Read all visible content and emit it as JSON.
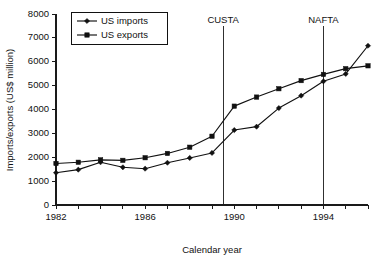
{
  "chart_data": {
    "type": "line",
    "title": "",
    "xlabel": "Calendar year",
    "ylabel": "Imports/exports (US$ million)",
    "xlim": [
      1982,
      1996
    ],
    "ylim": [
      0,
      8000
    ],
    "grid": false,
    "legend_position": "top-left",
    "x": [
      1982,
      1983,
      1984,
      1985,
      1986,
      1987,
      1988,
      1989,
      1990,
      1991,
      1992,
      1993,
      1994,
      1995,
      1996
    ],
    "xtick_values": [
      1982,
      1983,
      1984,
      1985,
      1986,
      1987,
      1988,
      1989,
      1990,
      1991,
      1992,
      1993,
      1994,
      1995,
      1996
    ],
    "xtick_labels": [
      "1982",
      "",
      "",
      "",
      "1986",
      "",
      "",
      "",
      "1990",
      "",
      "",
      "",
      "1994",
      "",
      ""
    ],
    "ytick_values": [
      0,
      1000,
      2000,
      3000,
      4000,
      5000,
      6000,
      7000,
      8000
    ],
    "ytick_labels": [
      "0",
      "1000",
      "2000",
      "3000",
      "4000",
      "5000",
      "6000",
      "7000",
      "8000"
    ],
    "series": [
      {
        "name": "US imports",
        "marker": "diamond",
        "values": [
          1350,
          1480,
          1790,
          1580,
          1520,
          1770,
          1970,
          2180,
          3140,
          3280,
          4060,
          4580,
          5180,
          5490,
          6670
        ]
      },
      {
        "name": "US exports",
        "marker": "square",
        "values": [
          1740,
          1790,
          1890,
          1870,
          1980,
          2160,
          2420,
          2880,
          4140,
          4520,
          4870,
          5210,
          5470,
          5710,
          5830
        ]
      }
    ],
    "annotations": [
      {
        "label": "CUSTA",
        "x": 1989.5,
        "type": "vertical-line"
      },
      {
        "label": "NAFTA",
        "x": 1994.0,
        "type": "vertical-line"
      }
    ],
    "colors": {
      "line": "#111111",
      "axis": "#1a1a1a",
      "background": "#ffffff"
    }
  }
}
